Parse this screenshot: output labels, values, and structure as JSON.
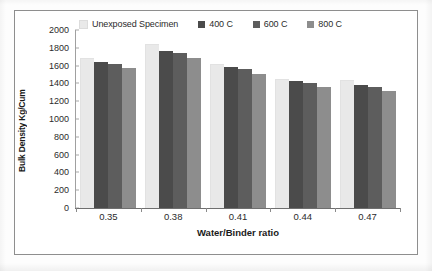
{
  "chart_data": {
    "type": "bar",
    "title": "",
    "xlabel": "Water/Binder ratio",
    "ylabel": "Bulk Density Kg/Cum",
    "categories": [
      "0.35",
      "0.38",
      "0.41",
      "0.44",
      "0.47"
    ],
    "series": [
      {
        "name": "Unexposed Specimen",
        "color": "#e9e9e9",
        "values": [
          1690,
          1840,
          1615,
          1455,
          1435
        ]
      },
      {
        "name": "400 C",
        "color": "#4b4b4b",
        "values": [
          1640,
          1765,
          1580,
          1430,
          1385
        ]
      },
      {
        "name": "600 C",
        "color": "#5d5d5d",
        "values": [
          1615,
          1740,
          1560,
          1410,
          1360
        ]
      },
      {
        "name": "800 C",
        "color": "#8d8d8d",
        "values": [
          1570,
          1685,
          1505,
          1360,
          1315
        ]
      }
    ],
    "ylim": [
      0,
      2000
    ],
    "ytick_step": 200,
    "yticks": [
      "2000",
      "1800",
      "1600",
      "1400",
      "1200",
      "1000",
      "800",
      "600",
      "400",
      "200",
      "0"
    ],
    "grid": false,
    "legend_position": "top"
  },
  "legend": {
    "entries": [
      {
        "label": "Unexposed Specimen",
        "color": "#e9e9e9"
      },
      {
        "label": "400 C",
        "color": "#4b4b4b"
      },
      {
        "label": "600 C",
        "color": "#5d5d5d"
      },
      {
        "label": "800 C",
        "color": "#8d8d8d"
      }
    ]
  },
  "axes": {
    "y_title": "Bulk Density Kg/Cum",
    "x_title": "Water/Binder ratio"
  }
}
